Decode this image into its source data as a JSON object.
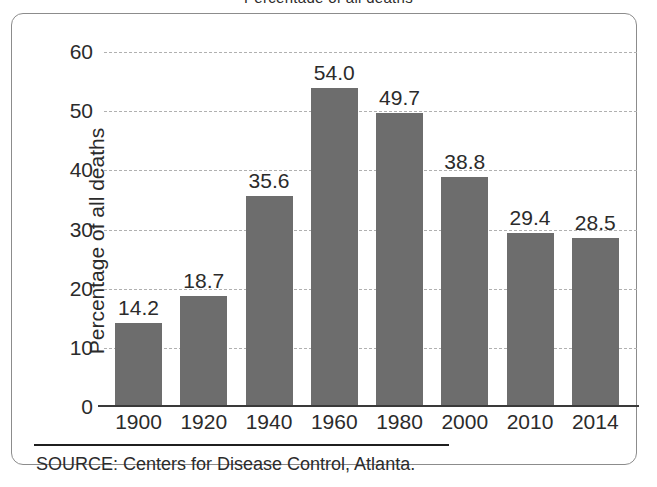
{
  "figure": {
    "title_clipped": "Percentage of all deaths",
    "source_note": "SOURCE: Centers for Disease Control, Atlanta.",
    "frame_color": "#8c8c8c",
    "bar_color": "#6d6d6d",
    "gridline_color": "#b0b0b0",
    "axis_color": "#3a3a3a"
  },
  "chart_data": {
    "type": "bar",
    "title": "",
    "xlabel": "",
    "ylabel": "Percentage of all deaths",
    "categories": [
      "1900",
      "1920",
      "1940",
      "1960",
      "1980",
      "2000",
      "2010",
      "2014"
    ],
    "values": [
      14.2,
      18.7,
      35.6,
      54.0,
      49.7,
      38.8,
      29.4,
      28.5
    ],
    "value_labels": [
      "14.2",
      "18.7",
      "35.6",
      "54.0",
      "49.7",
      "38.8",
      "29.4",
      "28.5"
    ],
    "ylim": [
      0,
      60
    ],
    "yticks": [
      0,
      10,
      20,
      30,
      40,
      50,
      60
    ],
    "ytick_labels": [
      "0",
      "10",
      "20",
      "30",
      "40",
      "50",
      "60"
    ],
    "grid": true,
    "grid_style": "dashed-horizontal",
    "legend": null,
    "annotations": [
      "SOURCE: Centers for Disease Control, Atlanta."
    ]
  }
}
